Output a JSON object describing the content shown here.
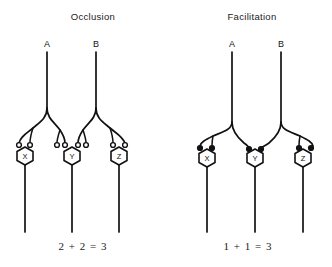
{
  "figure": {
    "background_color": "#ffffff",
    "ink_color": "#121212",
    "panels": [
      {
        "id": "occlusion",
        "title": "Occlusion",
        "title_x": 93,
        "title_y": 20,
        "equation": "2 + 2 = 3",
        "equation_x": 83,
        "equation_y": 250,
        "terminal_style": "open",
        "axons": [
          {
            "label": "A",
            "label_x": 47,
            "label_y": 47,
            "trunk_x": 47
          },
          {
            "label": "B",
            "label_x": 96,
            "label_y": 47,
            "trunk_x": 96
          }
        ],
        "neurons": [
          {
            "label": "X",
            "cx": 25,
            "cy": 155,
            "terminals": 2
          },
          {
            "label": "Y",
            "cx": 72,
            "cy": 155,
            "terminals": 4
          },
          {
            "label": "Z",
            "cx": 119,
            "cy": 155,
            "terminals": 2
          }
        ]
      },
      {
        "id": "facilitation",
        "title": "Facilitation",
        "title_x": 252,
        "title_y": 20,
        "equation": "1 + 1 = 3",
        "equation_x": 248,
        "equation_y": 250,
        "terminal_style": "filled",
        "axons": [
          {
            "label": "A",
            "label_x": 232,
            "label_y": 47,
            "trunk_x": 232
          },
          {
            "label": "B",
            "label_x": 281,
            "label_y": 47,
            "trunk_x": 281
          }
        ],
        "neurons": [
          {
            "label": "X",
            "cx": 207,
            "cy": 157,
            "terminals": 2
          },
          {
            "label": "Y",
            "cx": 255,
            "cy": 157,
            "terminals": 2
          },
          {
            "label": "Z",
            "cx": 303,
            "cy": 157,
            "terminals": 2
          }
        ]
      }
    ]
  }
}
